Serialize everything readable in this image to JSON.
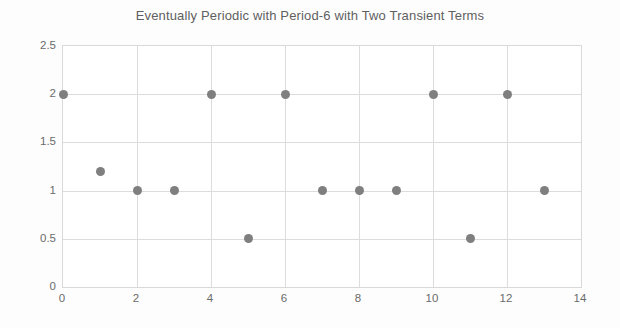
{
  "chart_data": {
    "type": "scatter",
    "title": "Eventually Periodic with Period-6 with Two Transient Terms",
    "xlabel": "",
    "ylabel": "",
    "x": [
      0,
      1,
      2,
      3,
      4,
      5,
      6,
      7,
      8,
      9,
      10,
      11,
      12,
      13
    ],
    "values": [
      2,
      1.2,
      1,
      1,
      2,
      0.5,
      2,
      1,
      1,
      1,
      2,
      0.5,
      2,
      1
    ],
    "xlim": [
      0,
      14
    ],
    "ylim": [
      0,
      2.5
    ],
    "x_ticks": [
      0,
      2,
      4,
      6,
      8,
      10,
      12,
      14
    ],
    "x_tick_labels": [
      "0",
      "2",
      "4",
      "6",
      "8",
      "10",
      "12",
      "14"
    ],
    "y_ticks": [
      0,
      0.5,
      1,
      1.5,
      2,
      2.5
    ],
    "y_tick_labels": [
      "0",
      "0.5",
      "1",
      "1.5",
      "2",
      "2.5"
    ],
    "grid": true,
    "legend": false,
    "marker_color": "#7f7f7f",
    "grid_color": "#dcdcdc",
    "title_color": "#5f5f5f",
    "tick_label_color": "#6b6b6b",
    "plot_background": "#ffffff",
    "figure_background": "#fdfdfd"
  }
}
